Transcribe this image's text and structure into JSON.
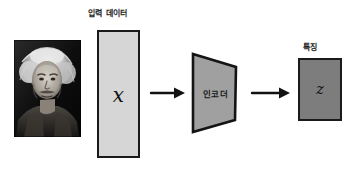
{
  "diagram": {
    "title_hidden": "",
    "labels": {
      "input_data": "입력 데이터",
      "encoder": "인코더",
      "feature": "특징"
    },
    "glyphs": {
      "input_symbol": "x",
      "latent_symbol": "z"
    },
    "photo": {
      "name": "einstein-portrait",
      "alt": "Einstein grayscale portrait"
    },
    "arrows": [
      {
        "name": "arrow-photo-to-encoder",
        "direction": "right"
      },
      {
        "name": "arrow-encoder-to-feature",
        "direction": "right"
      }
    ],
    "colors": {
      "input_rect_fill": "#d6d6d6",
      "encoder_fill": "#a0a0a0",
      "feature_fill": "#7d7d7d",
      "stroke": "#1a1a1a",
      "text": "#1d1d1d",
      "background": "#ffffff"
    }
  }
}
